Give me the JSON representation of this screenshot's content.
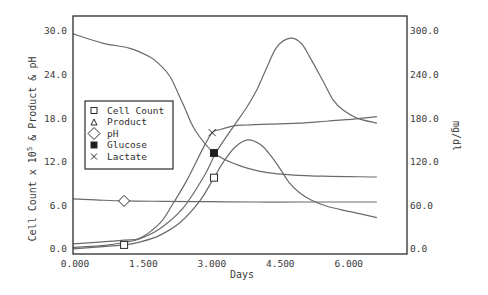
{
  "chart_data": {
    "type": "line",
    "title": "",
    "xlabel": "Days",
    "ylabel": "Cell Count x 10^5 & Product & pH",
    "ylabel_parts": {
      "pre": "Cell Count x 10",
      "sup": "5",
      "post": " & Product & pH"
    },
    "ylabel_right": "mg/dl",
    "xlim": [
      0,
      7.32
    ],
    "ylim": [
      -0.7,
      32.05
    ],
    "ylim_right": [
      -7,
      320.5
    ],
    "xticks": [
      0,
      1.5,
      3,
      4.5,
      6
    ],
    "xtick_labels": [
      "0.000",
      "1.500",
      "3.000",
      "4.500",
      "6.000"
    ],
    "yticks": [
      0,
      6,
      12,
      18,
      24,
      30
    ],
    "ytick_labels": [
      "0.0",
      "6.0",
      "12.0",
      "18.0",
      "24.0",
      "30.0"
    ],
    "yticks_right": [
      0,
      60,
      120,
      180,
      240,
      300
    ],
    "ytick_labels_right": [
      "0.0",
      "60.0",
      "120.0",
      "180.0",
      "240.0",
      "300.0"
    ],
    "grid": false,
    "legend_position": "inside plot, left-center",
    "series": [
      {
        "name": "Cell Count",
        "marker": "square-open",
        "axis": "left",
        "x": [
          0,
          0.5,
          1.12,
          1.5,
          1.91,
          2.34,
          2.78,
          3.09,
          3.3,
          3.55,
          3.83,
          4.1,
          4.3,
          4.51,
          4.73,
          4.95,
          5.23,
          5.6,
          6.1,
          6.66
        ],
        "y": [
          0.0,
          0.25,
          0.55,
          1.0,
          1.9,
          3.6,
          6.6,
          9.8,
          12.0,
          14.0,
          15.0,
          14.4,
          13.1,
          11.3,
          9.2,
          7.8,
          6.7,
          5.8,
          5.1,
          4.3
        ],
        "marker_points": [
          [
            1.12,
            0.55
          ],
          [
            3.09,
            9.8
          ]
        ]
      },
      {
        "name": "Product",
        "marker": "triangle-open",
        "axis": "left",
        "x": [
          0,
          0.7,
          1.12,
          1.47,
          1.91,
          2.41,
          2.89,
          3.13,
          3.51,
          3.81,
          4.03,
          4.25,
          4.47,
          4.76,
          5.0,
          5.19,
          5.47,
          5.7,
          5.92,
          6.22,
          6.66
        ],
        "y": [
          0.2,
          0.5,
          0.9,
          1.4,
          2.8,
          5.6,
          10.2,
          13.2,
          16.8,
          19.5,
          21.9,
          25.0,
          27.8,
          29.0,
          28.3,
          26.4,
          23.2,
          20.5,
          19.1,
          18.0,
          17.3
        ],
        "marker_points": []
      },
      {
        "name": "pH",
        "marker": "diamond-open",
        "axis": "left",
        "x": [
          0,
          0.5,
          1.12,
          2.0,
          3.0,
          4.0,
          5.0,
          6.66
        ],
        "y": [
          6.9,
          6.75,
          6.6,
          6.55,
          6.5,
          6.45,
          6.45,
          6.45
        ],
        "marker_points": [
          [
            1.12,
            6.6
          ]
        ]
      },
      {
        "name": "Glucose",
        "marker": "square-filled",
        "axis": "right",
        "x": [
          0,
          0.66,
          1.25,
          1.69,
          1.91,
          2.13,
          2.34,
          2.45,
          2.67,
          3.09,
          3.59,
          4.16,
          4.76,
          5.5,
          6.66
        ],
        "y": [
          296,
          283,
          276,
          264,
          253,
          237,
          209,
          194,
          164,
          132,
          116,
          106,
          102,
          100,
          99
        ],
        "marker_points": [
          [
            3.09,
            132
          ]
        ]
      },
      {
        "name": "Lactate",
        "marker": "x",
        "axis": "right",
        "x": [
          0,
          0.5,
          1.12,
          1.47,
          1.91,
          2.17,
          2.5,
          2.83,
          3.05,
          3.22,
          3.5,
          3.81,
          4.5,
          4.97,
          5.6,
          6.2,
          6.66
        ],
        "y": [
          7,
          9,
          12,
          15,
          36,
          60,
          95,
          136,
          160,
          164,
          169,
          170.5,
          172,
          173,
          176,
          179,
          182
        ],
        "marker_points": [
          [
            3.05,
            160
          ]
        ]
      }
    ]
  },
  "colors": {
    "background": "#ffffff",
    "frame": "#2b2b2b",
    "line": "#6a6a6a",
    "text": "#3a3a3a",
    "marker_fill": "#1e1e1e"
  }
}
